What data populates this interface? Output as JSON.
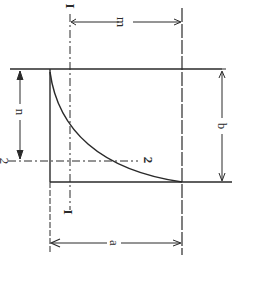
{
  "diagram": {
    "colors": {
      "line": "#2a2a2a",
      "background": "#ffffff"
    },
    "labels": {
      "m": "m",
      "n": "n",
      "a": "a",
      "b": "b",
      "axis1_top": "I",
      "axis1_bottom": "I",
      "axis2_left": "2",
      "axis2_right": "2"
    },
    "dimensions": [
      {
        "name": "m",
        "meaning": "horizontal offset from axis 1 to edge"
      },
      {
        "name": "n",
        "meaning": "vertical offset from top edge to axis 2"
      },
      {
        "name": "a",
        "meaning": "width of figure"
      },
      {
        "name": "b",
        "meaning": "height of figure"
      }
    ],
    "axes": [
      {
        "name": "1-1",
        "orientation": "vertical",
        "style": "dash-dot"
      },
      {
        "name": "2-2",
        "orientation": "horizontal",
        "style": "dash-dot"
      }
    ]
  }
}
